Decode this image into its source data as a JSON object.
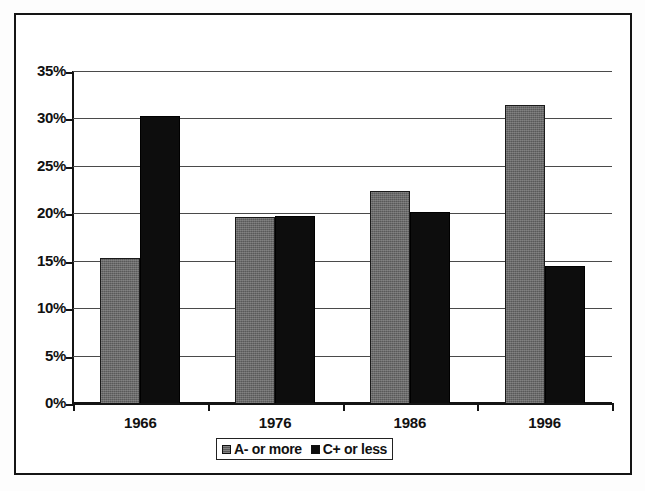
{
  "chart_data": {
    "type": "bar",
    "title": "",
    "subtitle": "",
    "xlabel": "",
    "ylabel": "",
    "categories": [
      "1966",
      "1976",
      "1986",
      "1996"
    ],
    "series": [
      {
        "name": "A- or more",
        "color": "#595959",
        "values": [
          15.4,
          19.7,
          22.5,
          31.5
        ]
      },
      {
        "name": "C+ or less",
        "color": "#0d0d0d",
        "values": [
          30.4,
          19.8,
          20.2,
          14.5
        ]
      }
    ],
    "ylim": [
      0,
      35
    ],
    "ytick_values": [
      0,
      5,
      10,
      15,
      20,
      25,
      30,
      35
    ],
    "ytick_labels": [
      "0%",
      "5%",
      "10%",
      "15%",
      "20%",
      "25%",
      "30%",
      "35%"
    ],
    "value_suffix": "%",
    "grid": true,
    "grid_axis": "y",
    "legend_position": "bottom",
    "legend_entries": [
      "A- or more",
      "C+ or less"
    ],
    "frame": true
  },
  "axes": {
    "y_axis_name": "percent-axis",
    "x_axis_name": "year-axis"
  }
}
